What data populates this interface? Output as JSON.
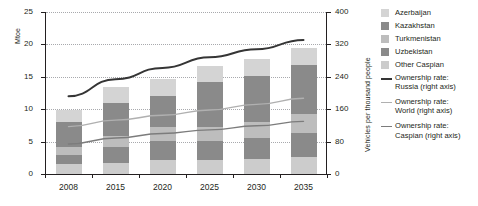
{
  "chart_data": {
    "type": "bar",
    "title": "",
    "subtitle": "",
    "xlabel": "",
    "ylabel": "Mtoe",
    "ylabel_right": "Vehicles per thousand people",
    "categories": [
      "2008",
      "2015",
      "2020",
      "2025",
      "2030",
      "2035"
    ],
    "ylim": [
      0,
      25
    ],
    "yticks": [
      "0",
      "5",
      "10",
      "15",
      "20",
      "25"
    ],
    "ylim_right": [
      0,
      400
    ],
    "yticks_right": [
      "0",
      "80",
      "160",
      "240",
      "320",
      "400"
    ],
    "grid": true,
    "legend_position": "right",
    "stacked": true,
    "series": [
      {
        "name": "Other Caspian",
        "color": "#cccccc",
        "values": [
          1.6,
          1.7,
          2.1,
          2.2,
          2.3,
          2.6
        ]
      },
      {
        "name": "Uzbekistan",
        "color": "#8a8a8a",
        "values": [
          1.4,
          2.5,
          3.0,
          2.9,
          3.3,
          3.8
        ]
      },
      {
        "name": "Turkmenistan",
        "color": "#bdbdbd",
        "values": [
          1.1,
          1.7,
          2.2,
          2.2,
          2.4,
          2.8
        ]
      },
      {
        "name": "Kazakhstan",
        "color": "#8a8a8a",
        "values": [
          4.0,
          5.0,
          4.8,
          6.9,
          7.2,
          7.6
        ]
      },
      {
        "name": "Azerbaijan",
        "color": "#d4d4d4",
        "values": [
          1.8,
          2.5,
          2.5,
          2.5,
          2.6,
          2.7
        ]
      }
    ],
    "lines": [
      {
        "name": "Ownership rate: Russia (right axis)",
        "label": "Ownership rate:\nRussia (right axis)",
        "color": "#353535",
        "axis": "right",
        "x": [
          "2008",
          "2015",
          "2020",
          "2025",
          "2030",
          "2035"
        ],
        "values": [
          192,
          234,
          262,
          288,
          308,
          331
        ]
      },
      {
        "name": "Ownership rate: World (right axis)",
        "label": "Ownership rate:\nWorld (right axis)",
        "color": "#b0b0b0",
        "axis": "right",
        "x": [
          "2008",
          "2015",
          "2020",
          "2025",
          "2030",
          "2035"
        ],
        "values": [
          117,
          133,
          145,
          158,
          172,
          187
        ]
      },
      {
        "name": "Ownership rate: Caspian (right axis)",
        "label": "Ownership rate:\nCaspian (right axis)",
        "color": "#7c7c7c",
        "axis": "right",
        "x": [
          "2008",
          "2015",
          "2020",
          "2025",
          "2030",
          "2035"
        ],
        "values": [
          74,
          89,
          100,
          109,
          119,
          130
        ]
      }
    ],
    "totals": [
      9.9,
      13.4,
      14.6,
      16.7,
      17.8,
      19.5
    ]
  },
  "legend": {
    "items": [
      {
        "label": "Azerbaijan",
        "color": "#d4d4d4",
        "kind": "swatch"
      },
      {
        "label": "Kazakhstan",
        "color": "#8a8a8a",
        "kind": "swatch"
      },
      {
        "label": "Turkmenistan",
        "color": "#bdbdbd",
        "kind": "swatch"
      },
      {
        "label": "Uzbekistan",
        "color": "#8a8a8a",
        "kind": "swatch"
      },
      {
        "label": "Other Caspian",
        "color": "#cccccc",
        "kind": "swatch"
      },
      {
        "label": "Ownership rate:\nRussia (right axis)",
        "color": "#353535",
        "kind": "line"
      },
      {
        "label": "Ownership rate:\nWorld (right axis)",
        "color": "#b0b0b0",
        "kind": "line"
      },
      {
        "label": "Ownership rate:\nCaspian (right axis)",
        "color": "#7c7c7c",
        "kind": "line"
      }
    ]
  },
  "axes": {
    "left_title": "Mtoe",
    "right_title": "Vehicles per thousand people"
  }
}
